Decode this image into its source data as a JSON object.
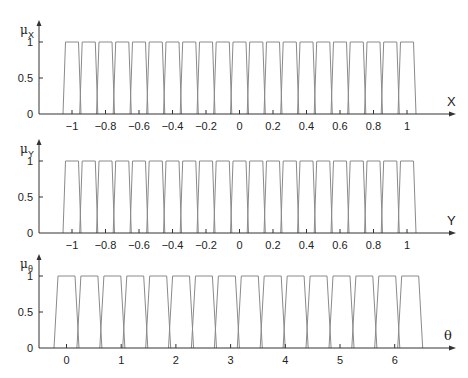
{
  "chart_data": [
    {
      "type": "line",
      "title": "",
      "ylabel": "μ_X",
      "xlabel": "X",
      "description": "21 trapezoidal membership functions, centers at -1.0 to 1.0 step 0.1",
      "x_ticks": [
        -1,
        -0.8,
        -0.6,
        -0.4,
        -0.2,
        0,
        0.2,
        0.4,
        0.6,
        0.8,
        1
      ],
      "x_tick_labels": [
        "−1",
        "−0.8",
        "−0.6",
        "−0.4",
        "−0.2",
        "0",
        "0.2",
        "0.4",
        "0.6",
        "0.8",
        "1"
      ],
      "y_ticks": [
        0,
        0.5,
        1
      ],
      "y_tick_labels": [
        "0",
        "0.5",
        "1"
      ],
      "xlim": [
        -1.2,
        1.3
      ],
      "ylim": [
        0,
        1.3
      ],
      "grid": false,
      "mf_centers": [
        -1.0,
        -0.9,
        -0.8,
        -0.7,
        -0.6,
        -0.5,
        -0.4,
        -0.3,
        -0.2,
        -0.1,
        0.0,
        0.1,
        0.2,
        0.3,
        0.4,
        0.5,
        0.6,
        0.7,
        0.8,
        0.9,
        1.0
      ],
      "mf_half_base": 0.054,
      "mf_half_top": 0.039,
      "mf_height": 1
    },
    {
      "type": "line",
      "title": "",
      "ylabel": "μ_Y",
      "xlabel": "Y",
      "description": "21 trapezoidal membership functions, centers at -1.0 to 1.0 step 0.1",
      "x_ticks": [
        -1,
        -0.8,
        -0.6,
        -0.4,
        -0.2,
        0,
        0.2,
        0.4,
        0.6,
        0.8,
        1
      ],
      "x_tick_labels": [
        "−1",
        "−0.8",
        "−0.6",
        "−0.4",
        "−0.2",
        "0",
        "0.2",
        "0.4",
        "0.6",
        "0.8",
        "1"
      ],
      "y_ticks": [
        0,
        0.5,
        1
      ],
      "y_tick_labels": [
        "0",
        "0.5",
        "1"
      ],
      "xlim": [
        -1.2,
        1.3
      ],
      "ylim": [
        0,
        1.3
      ],
      "grid": false,
      "mf_centers": [
        -1.0,
        -0.9,
        -0.8,
        -0.7,
        -0.6,
        -0.5,
        -0.4,
        -0.3,
        -0.2,
        -0.1,
        0.0,
        0.1,
        0.2,
        0.3,
        0.4,
        0.5,
        0.6,
        0.7,
        0.8,
        0.9,
        1.0
      ],
      "mf_half_base": 0.054,
      "mf_half_top": 0.039,
      "mf_height": 1
    },
    {
      "type": "line",
      "title": "",
      "ylabel": "μ_θ",
      "xlabel": "θ",
      "description": "16 trapezoidal membership functions, centers at 0 to 2π step 2π/15",
      "x_ticks": [
        0,
        1,
        2,
        3,
        4,
        5,
        6
      ],
      "x_tick_labels": [
        "0",
        "1",
        "2",
        "3",
        "4",
        "5",
        "6"
      ],
      "y_ticks": [
        0,
        0.5,
        1
      ],
      "y_tick_labels": [
        "0",
        "0.5",
        "1"
      ],
      "xlim": [
        -0.5,
        7.2
      ],
      "ylim": [
        0,
        1.3
      ],
      "grid": false,
      "mf_centers": [
        0.0,
        0.419,
        0.838,
        1.257,
        1.676,
        2.094,
        2.513,
        2.932,
        3.351,
        3.77,
        4.189,
        4.608,
        5.027,
        5.445,
        5.864,
        6.283
      ],
      "mf_half_base": 0.229,
      "mf_half_top": 0.155,
      "mf_height": 1
    }
  ],
  "panels": [
    {
      "mu_symbol": "μ",
      "mu_subscript": "X",
      "axis_name": "X",
      "y_tick_labels": [
        "0",
        "0.5",
        "1"
      ],
      "x_tick_labels": [
        "−1",
        "−0.8",
        "−0.6",
        "−0.4",
        "−0.2",
        "0",
        "0.2",
        "0.4",
        "0.6",
        "0.8",
        "1"
      ]
    },
    {
      "mu_symbol": "μ",
      "mu_subscript": "Y",
      "axis_name": "Y",
      "y_tick_labels": [
        "0",
        "0.5",
        "1"
      ],
      "x_tick_labels": [
        "−1",
        "−0.8",
        "−0.6",
        "−0.4",
        "−0.2",
        "0",
        "0.2",
        "0.4",
        "0.6",
        "0.8",
        "1"
      ]
    },
    {
      "mu_symbol": "μ",
      "mu_subscript": "θ",
      "axis_name": "θ",
      "y_tick_labels": [
        "0",
        "0.5",
        "1"
      ],
      "x_tick_labels": [
        "0",
        "1",
        "2",
        "3",
        "4",
        "5",
        "6"
      ]
    }
  ],
  "colors": {
    "axis": "#333333",
    "membership_line": "#8a8a8a",
    "background": "#ffffff"
  }
}
